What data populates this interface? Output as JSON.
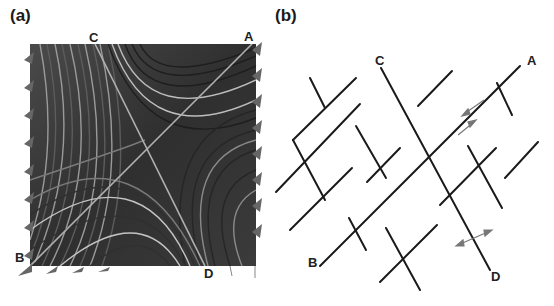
{
  "panels": [
    {
      "id": "a",
      "label": "(a)",
      "description": "Streamline flow visualization around a saddle point",
      "points": {
        "A": "A",
        "B": "B",
        "C": "C",
        "D": "D"
      }
    },
    {
      "id": "b",
      "label": "(b)",
      "description": "Schematic of intersecting line segments (fracture/fault network)",
      "points": {
        "A": "A",
        "B": "B",
        "C": "C",
        "D": "D"
      }
    }
  ],
  "colors": {
    "streamline_dark": "#1e1e1e",
    "streamline_light": "#bdbdbd",
    "arrow_gray": "#666666",
    "line_black": "#1a1a1a",
    "shear_arrow": "#777777"
  }
}
